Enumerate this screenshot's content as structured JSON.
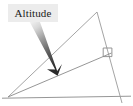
{
  "figure": {
    "kind": "geometry-diagram",
    "background_color": "#ffffff"
  },
  "callout": {
    "label": "Altitude",
    "box_fill": "#ececec",
    "text_color": "#1a1a1a",
    "arrow": {
      "name": "pointer-arrow",
      "color_start": "#f2f2f2",
      "color_end": "#2b2b2b",
      "from_x": 34,
      "from_y": 22,
      "to_x": 56,
      "to_y": 74
    }
  },
  "shape": {
    "stroke_color": "#8a8a8a",
    "stroke_width": 0.9,
    "vertices": {
      "base_left": {
        "x": 8,
        "y": 97
      },
      "base_right": {
        "x": 118,
        "y": 96
      },
      "apex": {
        "x": 97,
        "y": 12
      }
    },
    "base_line": {
      "x1": 2,
      "y1": 98,
      "x2": 131,
      "y2": 96
    },
    "altitude_segment": {
      "x1": 8,
      "y1": 97,
      "x2": 111,
      "y2": 53
    },
    "right_angle_marker": {
      "name": "right-angle-square",
      "x": 102,
      "y": 47,
      "size": 9
    }
  }
}
